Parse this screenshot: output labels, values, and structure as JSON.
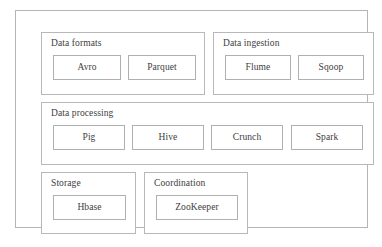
{
  "diagram": {
    "border_color": "#b5b5b5",
    "box_border_color": "#b0b0b0",
    "text_color": "#3d3d3d",
    "background_color": "#ffffff",
    "groups": [
      {
        "id": "data-formats",
        "label": "Data formats",
        "items": [
          {
            "id": "avro",
            "label": "Avro"
          },
          {
            "id": "parquet",
            "label": "Parquet"
          }
        ]
      },
      {
        "id": "data-ingestion",
        "label": "Data ingestion",
        "items": [
          {
            "id": "flume",
            "label": "Flume"
          },
          {
            "id": "sqoop",
            "label": "Sqoop"
          }
        ]
      },
      {
        "id": "data-processing",
        "label": "Data processing",
        "items": [
          {
            "id": "pig",
            "label": "Pig"
          },
          {
            "id": "hive",
            "label": "Hive"
          },
          {
            "id": "crunch",
            "label": "Crunch"
          },
          {
            "id": "spark",
            "label": "Spark"
          }
        ]
      },
      {
        "id": "storage",
        "label": "Storage",
        "items": [
          {
            "id": "hbase",
            "label": "Hbase"
          }
        ]
      },
      {
        "id": "coordination",
        "label": "Coordination",
        "items": [
          {
            "id": "zookeeper",
            "label": "ZooKeeper"
          }
        ]
      }
    ]
  }
}
